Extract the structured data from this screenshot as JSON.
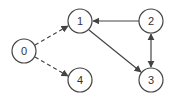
{
  "diagram": {
    "type": "directed-graph",
    "nodes": [
      {
        "id": "0",
        "label": "0",
        "x": 24,
        "y": 51
      },
      {
        "id": "1",
        "label": "1",
        "x": 80,
        "y": 21
      },
      {
        "id": "2",
        "label": "2",
        "x": 151,
        "y": 21
      },
      {
        "id": "3",
        "label": "3",
        "x": 151,
        "y": 80
      },
      {
        "id": "4",
        "label": "4",
        "x": 80,
        "y": 80
      }
    ],
    "edges": [
      {
        "from": "0",
        "to": "1",
        "style": "dashed",
        "direction": "forward"
      },
      {
        "from": "0",
        "to": "4",
        "style": "dashed",
        "direction": "forward"
      },
      {
        "from": "2",
        "to": "1",
        "style": "solid",
        "direction": "forward"
      },
      {
        "from": "1",
        "to": "3",
        "style": "solid",
        "direction": "forward"
      },
      {
        "from": "2",
        "to": "3",
        "style": "solid",
        "direction": "both"
      }
    ],
    "colors": {
      "stroke": "#444444",
      "fill": "#ffffff",
      "text": "#333333"
    }
  }
}
